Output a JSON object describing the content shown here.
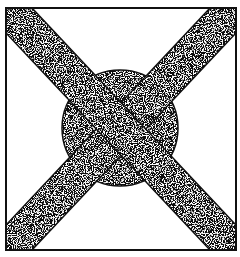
{
  "figure": {
    "colors": {
      "background": "#ffffff",
      "ink": "#111111",
      "stipple_light": "#f2f2f2"
    },
    "frame": {
      "x": 6,
      "y": 8,
      "width": 230,
      "height": 242,
      "stroke_width": 2
    },
    "blob": {
      "cx": 120,
      "cy": 128,
      "r": 58
    },
    "bands": [
      {
        "name": "band-top-left-to-bottom-right",
        "from": [
          6,
          8
        ],
        "to": [
          236,
          250
        ],
        "width": 38
      },
      {
        "name": "band-top-right-to-bottom-left",
        "from": [
          236,
          8
        ],
        "to": [
          6,
          250
        ],
        "width": 38
      }
    ]
  }
}
